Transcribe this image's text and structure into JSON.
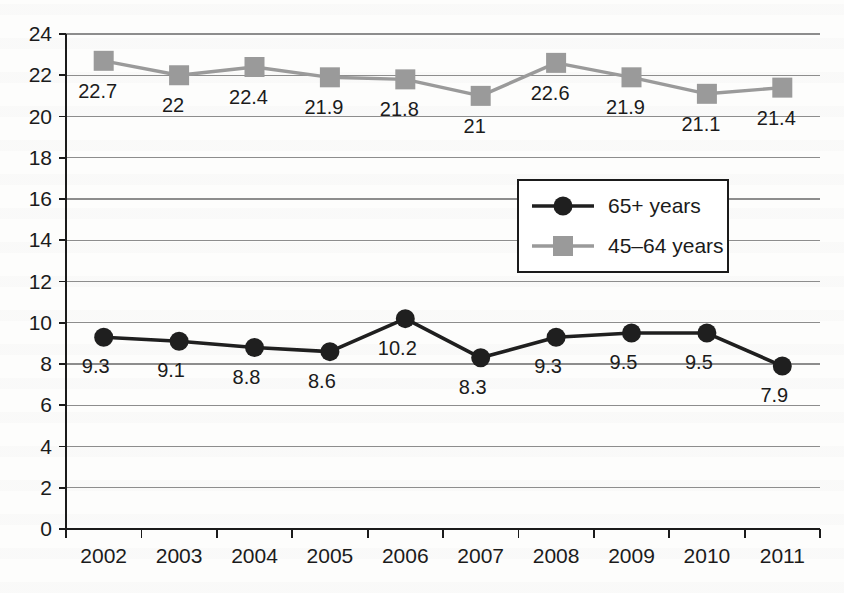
{
  "chart_data": {
    "type": "line",
    "title": "",
    "subtitle": "",
    "xlabel": "",
    "ylabel": "",
    "categories": [
      "2002",
      "2003",
      "2004",
      "2005",
      "2006",
      "2007",
      "2008",
      "2009",
      "2010",
      "2011"
    ],
    "ylim": [
      0,
      24
    ],
    "ytick_step": 2,
    "yticks": [
      "0",
      "2",
      "4",
      "6",
      "8",
      "10",
      "12",
      "14",
      "16",
      "18",
      "20",
      "22",
      "24"
    ],
    "grid": true,
    "legend_position": "center-right",
    "series": [
      {
        "name": "65+ years",
        "marker": "circle",
        "color": "#1f1f1f",
        "values": [
          9.3,
          9.1,
          8.8,
          8.6,
          10.2,
          8.3,
          9.3,
          9.5,
          9.5,
          7.9
        ],
        "labels": [
          "9.3",
          "9.1",
          "8.8",
          "8.6",
          "10.2",
          "8.3",
          "9.3",
          "9.5",
          "9.5",
          "7.9"
        ]
      },
      {
        "name": "45–64 years",
        "marker": "square",
        "color": "#9a9a9a",
        "values": [
          22.7,
          22.0,
          22.4,
          21.9,
          21.8,
          21.0,
          22.6,
          21.9,
          21.1,
          21.4
        ],
        "labels": [
          "22.7",
          "22",
          "22.4",
          "21.9",
          "21.8",
          "21",
          "22.6",
          "21.9",
          "21.1",
          "21.4"
        ]
      }
    ]
  },
  "legend": {
    "entries": [
      {
        "label": "65+ years"
      },
      {
        "label": "45–64 years"
      }
    ]
  },
  "colors": {
    "series_dark": "#1f1f1f",
    "series_gray": "#9a9a9a",
    "gridline": "#8d8d8d",
    "axis": "#1b1b1b",
    "background": "#fdfdfc"
  }
}
